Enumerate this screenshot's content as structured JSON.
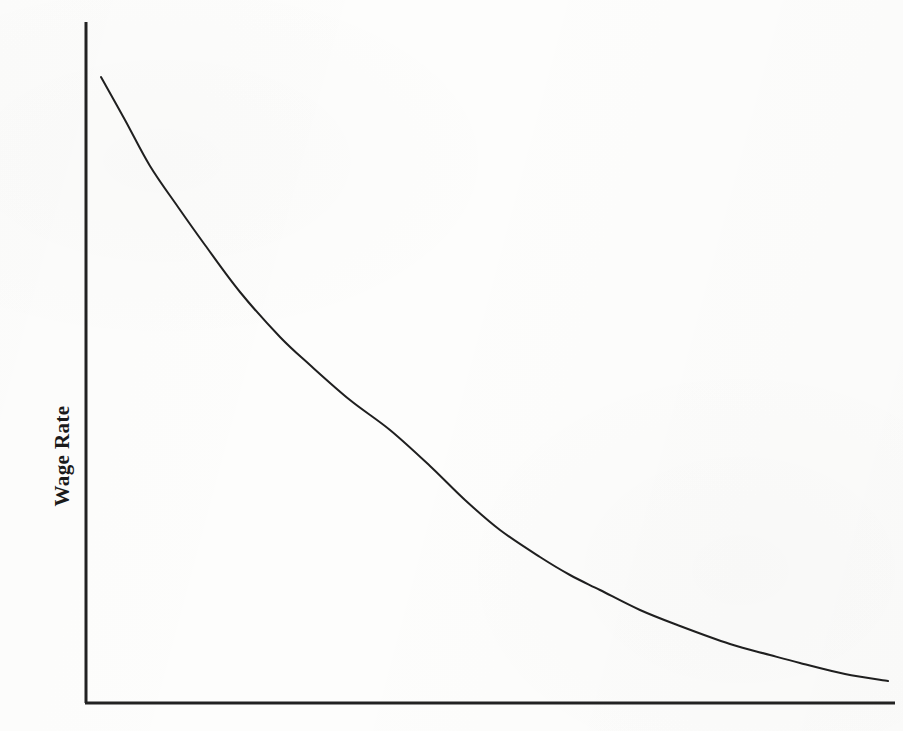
{
  "figure": {
    "background_color": "#fdfdfc",
    "ink_color": "#1f1f1f",
    "width": 903,
    "height": 731
  },
  "axes": {
    "y_axis_label": "Wage Rate",
    "x_axis_label": "",
    "y_axis_label_rotation_deg": -90,
    "axis_color": "#222222",
    "axis_stroke_width": 3,
    "origin": {
      "x": 86,
      "y": 703
    },
    "y_axis_top": {
      "x": 86,
      "y": 22
    },
    "x_axis_right": {
      "x": 895,
      "y": 703
    },
    "ticks_visible": false,
    "gridlines_visible": false,
    "tick_labels": []
  },
  "chart_data": {
    "type": "line",
    "title": "",
    "subtitle": "",
    "xlabel": "",
    "ylabel": "Wage Rate",
    "grid": false,
    "legend": [],
    "legend_position": "none",
    "annotations": [],
    "axis_ranges": {
      "xlim": [
        0,
        1
      ],
      "ylim": [
        0,
        1
      ]
    },
    "series": [
      {
        "name": "Labor Demand Curve",
        "color": "#1f1f1f",
        "stroke_width": 2,
        "shape": "convex-decreasing",
        "points_px": [
          [
            101,
            77
          ],
          [
            125,
            120
          ],
          [
            150,
            166
          ],
          [
            178,
            207
          ],
          [
            205,
            245
          ],
          [
            240,
            292
          ],
          [
            280,
            337
          ],
          [
            310,
            365
          ],
          [
            350,
            400
          ],
          [
            390,
            430
          ],
          [
            430,
            466
          ],
          [
            465,
            500
          ],
          [
            500,
            530
          ],
          [
            540,
            557
          ],
          [
            570,
            575
          ],
          [
            600,
            590
          ],
          [
            640,
            610
          ],
          [
            680,
            626
          ],
          [
            730,
            644
          ],
          [
            770,
            655
          ],
          [
            800,
            663
          ],
          [
            845,
            674
          ],
          [
            888,
            681
          ]
        ],
        "points_normalized": [
          {
            "x": 0.019,
            "y": 0.919
          },
          {
            "x": 0.048,
            "y": 0.856
          },
          {
            "x": 0.079,
            "y": 0.789
          },
          {
            "x": 0.114,
            "y": 0.728
          },
          {
            "x": 0.147,
            "y": 0.672
          },
          {
            "x": 0.19,
            "y": 0.603
          },
          {
            "x": 0.24,
            "y": 0.537
          },
          {
            "x": 0.277,
            "y": 0.496
          },
          {
            "x": 0.327,
            "y": 0.445
          },
          {
            "x": 0.376,
            "y": 0.401
          },
          {
            "x": 0.425,
            "y": 0.348
          },
          {
            "x": 0.469,
            "y": 0.298
          },
          {
            "x": 0.512,
            "y": 0.254
          },
          {
            "x": 0.561,
            "y": 0.214
          },
          {
            "x": 0.599,
            "y": 0.188
          },
          {
            "x": 0.636,
            "y": 0.166
          },
          {
            "x": 0.685,
            "y": 0.136
          },
          {
            "x": 0.734,
            "y": 0.113
          },
          {
            "x": 0.796,
            "y": 0.087
          },
          {
            "x": 0.845,
            "y": 0.07
          },
          {
            "x": 0.882,
            "y": 0.059
          },
          {
            "x": 0.938,
            "y": 0.043
          },
          {
            "x": 0.991,
            "y": 0.032
          }
        ]
      }
    ]
  }
}
